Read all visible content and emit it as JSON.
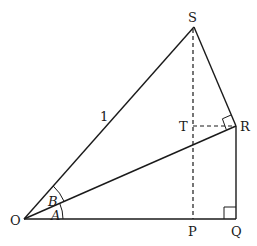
{
  "diagram": {
    "title": "",
    "points": {
      "O": {
        "label": "O",
        "x": 24,
        "y": 219
      },
      "S": {
        "label": "S",
        "x": 194,
        "y": 27
      },
      "R": {
        "label": "R",
        "x": 236,
        "y": 126
      },
      "Q": {
        "label": "Q",
        "x": 236,
        "y": 219
      },
      "P": {
        "label": "P",
        "x": 193,
        "y": 219
      },
      "T": {
        "label": "T",
        "x": 193,
        "y": 126
      }
    },
    "segments": [
      {
        "from": "O",
        "to": "S",
        "style": "solid",
        "label": "1"
      },
      {
        "from": "S",
        "to": "R",
        "style": "solid"
      },
      {
        "from": "O",
        "to": "R",
        "style": "solid"
      },
      {
        "from": "R",
        "to": "Q",
        "style": "solid"
      },
      {
        "from": "O",
        "to": "Q",
        "style": "solid"
      },
      {
        "from": "S",
        "to": "P",
        "style": "dashed"
      },
      {
        "from": "T",
        "to": "R",
        "style": "dashed"
      }
    ],
    "angles": {
      "A": {
        "label": "A",
        "vertex": "O",
        "between": [
          "Q",
          "R"
        ]
      },
      "B": {
        "label": "B",
        "vertex": "O",
        "between": [
          "R",
          "S"
        ]
      }
    },
    "right_angles": [
      "Q",
      "R"
    ],
    "side_label_OS": "1",
    "colors": {
      "stroke": "#1a1a1a",
      "background": "#ffffff"
    }
  }
}
